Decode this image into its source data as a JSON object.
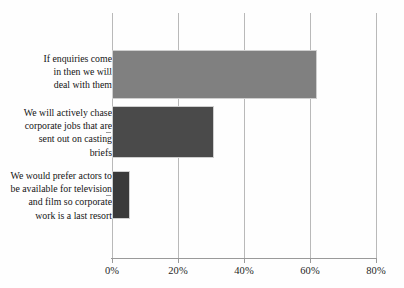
{
  "chart_data": {
    "type": "bar",
    "orientation": "horizontal",
    "title": "",
    "subtitle": "",
    "xlabel": "",
    "ylabel": "",
    "categories": [
      "If enquiries come in then we will deal with them",
      "We will actively chase corporate jobs that are sent out on casting briefs",
      "We would prefer actors to be available for television and film so corporate work is a last resort"
    ],
    "values": [
      62,
      31,
      5.5
    ],
    "value_format": "percent",
    "xlim": [
      0,
      80
    ],
    "xticks": [
      0,
      20,
      40,
      60,
      80
    ],
    "xtick_labels": [
      "0%",
      "20%",
      "40%",
      "60%",
      "80%"
    ],
    "grid": "vertical",
    "legend": "none",
    "bar_colors": [
      "#808080",
      "#4a4a4a",
      "#3a3a3a"
    ],
    "bar_border_color": "#cfcfcf",
    "axis_color": "#9a9a9a",
    "gridline_color": "#b9b9b9",
    "background_color": "#fefefe"
  },
  "labels": {
    "bar_1_lines": [
      "If enquiries come",
      "in then we will",
      "deal with them"
    ],
    "bar_2_lines": [
      "We will actively chase",
      "corporate jobs that are",
      "sent out on casting",
      "briefs"
    ],
    "bar_3_lines": [
      "We would prefer actors to",
      "be available for television",
      "and film so corporate",
      "work is a last resort"
    ]
  }
}
